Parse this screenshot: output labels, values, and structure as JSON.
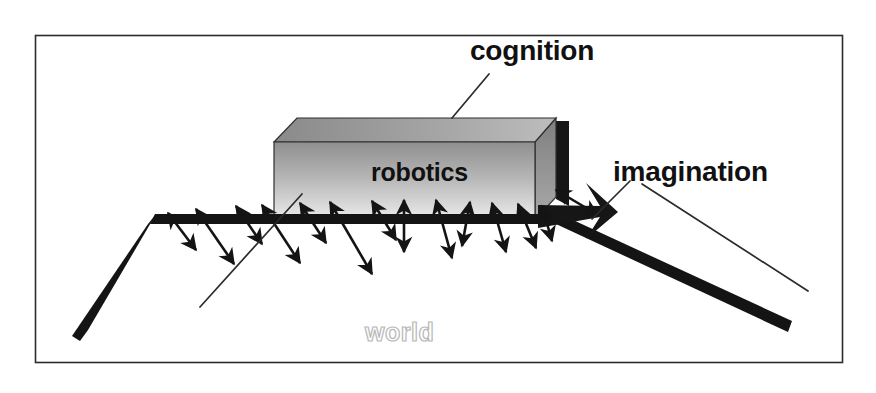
{
  "diagram": {
    "frame": {
      "x": 35,
      "y": 35,
      "width": 808,
      "height": 328,
      "stroke": "#2b2b2b",
      "fill": "#ffffff"
    },
    "labels": {
      "cognition": "cognition",
      "imagination": "imagination",
      "robotics": "robotics",
      "world": "world"
    },
    "colors": {
      "ink": "#111111",
      "frame_stroke": "#2b2b2b",
      "box_front_top": "#9a9a9a",
      "box_front_bottom": "#e8e8e8",
      "box_top_left": "#8d8d8d",
      "box_top_right": "#b4b4b4",
      "box_side": "#8a8a8a",
      "box_edge": "#1a1a1a",
      "shadow": "#161616",
      "ground": "#141414",
      "arrow": "#141414",
      "world_text_outline": "#b9b9b9",
      "world_text_fill": "#ffffff",
      "leader_line": "#2b2b2b"
    },
    "box": {
      "name": "robotics-box",
      "front": [
        [
          274,
          142
        ],
        [
          535,
          142
        ],
        [
          535,
          220
        ],
        [
          274,
          220
        ]
      ],
      "top": [
        [
          274,
          142
        ],
        [
          297,
          118
        ],
        [
          556,
          118
        ],
        [
          535,
          142
        ]
      ],
      "side": [
        [
          535,
          142
        ],
        [
          556,
          118
        ],
        [
          556,
          196
        ],
        [
          535,
          220
        ]
      ],
      "shadow_edge": [
        [
          556,
          120
        ],
        [
          568,
          120
        ],
        [
          568,
          205
        ],
        [
          556,
          205
        ]
      ]
    },
    "ground": {
      "name": "world-ground-line",
      "apex_left": [
        150,
        219
      ],
      "apex_right": [
        566,
        219
      ],
      "left_end": [
        84,
        336
      ],
      "right_end": [
        790,
        327
      ],
      "thickness": 9
    },
    "leaders": [
      {
        "name": "cognition-leader",
        "from": [
          489,
          74
        ],
        "to": [
          455,
          117
        ]
      },
      {
        "name": "imagination-leader-short",
        "from": [
          629,
          182
        ],
        "to": [
          595,
          218
        ]
      },
      {
        "name": "imagination-leader-long",
        "from": [
          640,
          185
        ],
        "to": [
          806,
          290
        ]
      },
      {
        "name": "world-leader",
        "from": [
          300,
          195
        ],
        "to": [
          202,
          305
        ]
      }
    ],
    "arrows": {
      "name": "interaction-arrows",
      "description": "double-headed arrows radiating downward from the robotics box base into the world",
      "count": 14,
      "items": [
        {
          "x1": 168,
          "y1": 213,
          "x2": 196,
          "y2": 250
        },
        {
          "x1": 196,
          "y1": 209,
          "x2": 234,
          "y2": 264
        },
        {
          "x1": 236,
          "y1": 206,
          "x2": 262,
          "y2": 244
        },
        {
          "x1": 262,
          "y1": 205,
          "x2": 300,
          "y2": 263
        },
        {
          "x1": 300,
          "y1": 203,
          "x2": 326,
          "y2": 243
        },
        {
          "x1": 330,
          "y1": 202,
          "x2": 372,
          "y2": 274
        },
        {
          "x1": 372,
          "y1": 201,
          "x2": 396,
          "y2": 240
        },
        {
          "x1": 404,
          "y1": 200,
          "x2": 404,
          "y2": 252
        },
        {
          "x1": 436,
          "y1": 200,
          "x2": 452,
          "y2": 258
        },
        {
          "x1": 470,
          "y1": 202,
          "x2": 462,
          "y2": 246
        },
        {
          "x1": 492,
          "y1": 203,
          "x2": 506,
          "y2": 252
        },
        {
          "x1": 518,
          "y1": 204,
          "x2": 536,
          "y2": 248
        },
        {
          "x1": 542,
          "y1": 206,
          "x2": 552,
          "y2": 241
        },
        {
          "x1": 556,
          "y1": 190,
          "x2": 598,
          "y2": 215
        }
      ]
    }
  }
}
